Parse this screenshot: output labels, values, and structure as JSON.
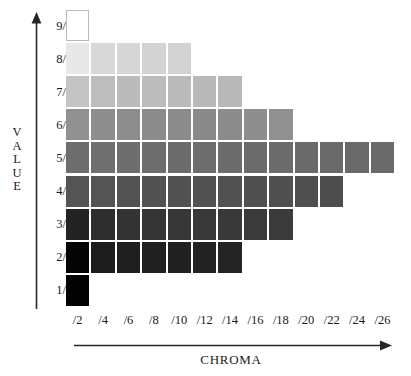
{
  "chart_data": {
    "type": "heatmap",
    "title": "",
    "xlabel": "CHROMA",
    "ylabel": "VALUE",
    "grid": false,
    "legend": "none",
    "x_tick_labels": [
      "/2",
      "/4",
      "/6",
      "/8",
      "/10",
      "/12",
      "/14",
      "/16",
      "/18",
      "/20",
      "/22",
      "/24",
      "/26"
    ],
    "y_tick_labels": [
      "9/",
      "8/",
      "7/",
      "6/",
      "5/",
      "4/",
      "3/",
      "2/",
      "1/"
    ],
    "x_values": [
      2,
      4,
      6,
      8,
      10,
      12,
      14,
      16,
      18,
      20,
      22,
      24,
      26
    ],
    "y_values": [
      9,
      8,
      7,
      6,
      5,
      4,
      3,
      2,
      1
    ],
    "xlim": [
      2,
      26
    ],
    "ylim": [
      1,
      9
    ],
    "note": "Munsell value/chroma swatch chart: each row (value) spans a different number of chroma columns",
    "rows": [
      {
        "value": 9,
        "label": "9/",
        "count": 1,
        "colors": [
          "#ffffff"
        ]
      },
      {
        "value": 8,
        "label": "8/",
        "count": 5,
        "colors": [
          "#e8e8e8",
          "#d8d8d8",
          "#d6d6d6",
          "#d3d3d3",
          "#d2d2d2"
        ]
      },
      {
        "value": 7,
        "label": "7/",
        "count": 7,
        "colors": [
          "#c4c4c4",
          "#bdbdbd",
          "#bbbbbb",
          "#bcbcbc",
          "#bababa",
          "#b9b9b9",
          "#b8b8b8"
        ]
      },
      {
        "value": 6,
        "label": "6/",
        "count": 9,
        "colors": [
          "#919191",
          "#8e8e8e",
          "#8d8d8d",
          "#8c8c8c",
          "#8b8b8b",
          "#8a8a8a",
          "#8c8c8c",
          "#8e8e8e",
          "#909090"
        ]
      },
      {
        "value": 5,
        "label": "5/",
        "count": 13,
        "colors": [
          "#6e6e6e",
          "#6f6f6f",
          "#6e6e6e",
          "#6d6d6d",
          "#6c6c6c",
          "#6d6d6d",
          "#6c6c6c",
          "#6b6b6b",
          "#6c6c6c",
          "#6a6a6a",
          "#6a6a6a",
          "#696969",
          "#6a6a6a"
        ]
      },
      {
        "value": 4,
        "label": "4/",
        "count": 11,
        "colors": [
          "#545454",
          "#545454",
          "#535353",
          "#525252",
          "#525252",
          "#515151",
          "#515151",
          "#505050",
          "#505050",
          "#4f4f4f",
          "#4e4e4e"
        ]
      },
      {
        "value": 3,
        "label": "3/",
        "count": 9,
        "colors": [
          "#232323",
          "#2e2e2e",
          "#333333",
          "#353535",
          "#373737",
          "#383838",
          "#393939",
          "#3a3a3a",
          "#3b3b3b"
        ]
      },
      {
        "value": 2,
        "label": "2/",
        "count": 7,
        "colors": [
          "#050505",
          "#1c1c1c",
          "#1f1f1f",
          "#202020",
          "#212121",
          "#222222",
          "#242424"
        ]
      },
      {
        "value": 1,
        "label": "1/",
        "count": 1,
        "colors": [
          "#030303"
        ]
      }
    ]
  },
  "axes": {
    "value_label_letters": [
      "V",
      "A",
      "L",
      "U",
      "E"
    ],
    "chroma_label": "CHROMA"
  },
  "colors": {
    "axis_line": "#262626",
    "cell_border": "#b9b9b9",
    "background": "#ffffff",
    "text": "#1a1a1a"
  }
}
